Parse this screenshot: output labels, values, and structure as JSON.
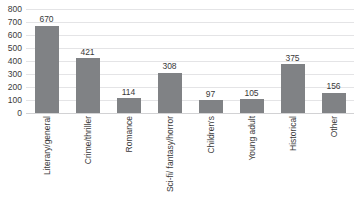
{
  "chart_data": {
    "type": "bar",
    "title": "",
    "subtitle": "",
    "xlabel": "",
    "ylabel": "",
    "ylim": [
      0,
      800
    ],
    "ytick_step": 100,
    "yticks": [
      "800",
      "700",
      "600",
      "500",
      "400",
      "300",
      "200",
      "100",
      "0"
    ],
    "grid": true,
    "legend": false,
    "legend_position": "none",
    "bar_color": "#808285",
    "gridline_color": "#e4e4e6",
    "label_color": "#3a3a3a",
    "categories": [
      "Literary/general",
      "Crime/thriller",
      "Romance",
      "Sci-fi/ fantasy/horror",
      "Children's",
      "Young adult",
      "Historical",
      "Other"
    ],
    "values": [
      670,
      421,
      114,
      308,
      97,
      105,
      375,
      156
    ],
    "value_labels": [
      "670",
      "421",
      "114",
      "308",
      "97",
      "105",
      "375",
      "156"
    ]
  }
}
